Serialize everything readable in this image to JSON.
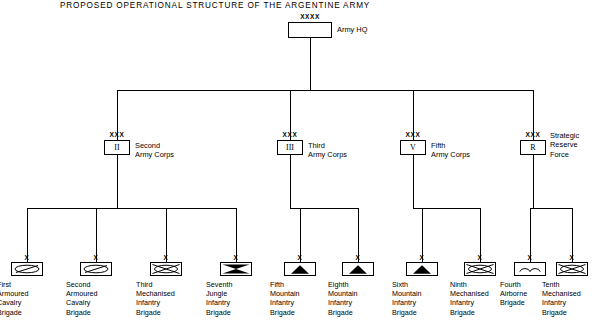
{
  "title": "PROPOSED OPERATIONAL STRUCTURE OF THE ARGENTINE ARMY",
  "hq": {
    "echelon": "XXXX",
    "label": "Army HQ",
    "symbol": "blank-hq-symbol"
  },
  "corps": [
    {
      "echelon": "XXX",
      "designator": "II",
      "label_lines": [
        "Second",
        "Army Corps"
      ],
      "symbol": "roman-numeral-2"
    },
    {
      "echelon": "XXX",
      "designator": "III",
      "label_lines": [
        "Third",
        "Army Corps"
      ],
      "symbol": "roman-numeral-3"
    },
    {
      "echelon": "XXX",
      "designator": "V",
      "label_lines": [
        "Fifth",
        "Army Corps"
      ],
      "symbol": "roman-numeral-5"
    },
    {
      "echelon": "XXX",
      "designator": "R",
      "label_lines": [
        "Strategic",
        "Reserve",
        "Force"
      ],
      "symbol": "reserve-force-r"
    }
  ],
  "brigades": [
    {
      "echelon": "X",
      "label_lines": [
        "First",
        "Armoured",
        "Cavalry",
        "Brigade"
      ],
      "symbol": "armoured-cavalry-symbol",
      "parent": "Second Army Corps"
    },
    {
      "echelon": "X",
      "label_lines": [
        "Second",
        "Armoured",
        "Cavalry",
        "Brigade"
      ],
      "symbol": "armoured-cavalry-symbol",
      "parent": "Second Army Corps"
    },
    {
      "echelon": "X",
      "label_lines": [
        "Third",
        "Mechanised",
        "Infantry",
        "Brigade"
      ],
      "symbol": "mechanised-infantry-symbol",
      "parent": "Second Army Corps"
    },
    {
      "echelon": "X",
      "label_lines": [
        "Seventh",
        "Jungle",
        "Infantry",
        "Brigade"
      ],
      "symbol": "jungle-infantry-symbol",
      "parent": "Second Army Corps"
    },
    {
      "echelon": "X",
      "label_lines": [
        "Fifth",
        "Mountain",
        "Infantry",
        "Brigade"
      ],
      "symbol": "mountain-infantry-symbol",
      "parent": "Third Army Corps"
    },
    {
      "echelon": "X",
      "label_lines": [
        "Eighth",
        "Mountain",
        "Infantry",
        "Brigade"
      ],
      "symbol": "mountain-infantry-symbol",
      "parent": "Third Army Corps"
    },
    {
      "echelon": "X",
      "label_lines": [
        "Sixth",
        "Mountain",
        "Infantry",
        "Brigade"
      ],
      "symbol": "mountain-infantry-symbol",
      "parent": "Fifth Army Corps"
    },
    {
      "echelon": "X",
      "label_lines": [
        "Ninth",
        "Mechanised",
        "Infantry",
        "Brigade"
      ],
      "symbol": "mechanised-infantry-symbol",
      "parent": "Fifth Army Corps"
    },
    {
      "echelon": "X",
      "label_lines": [
        "Fourth",
        "Airborne",
        "Brigade"
      ],
      "symbol": "airborne-symbol",
      "parent": "Strategic Reserve Force"
    },
    {
      "echelon": "X",
      "label_lines": [
        "Tenth",
        "Mechanised",
        "Infantry",
        "Brigade"
      ],
      "symbol": "mechanised-infantry-symbol",
      "parent": "Strategic Reserve Force"
    }
  ],
  "colors": {
    "line": "#000000",
    "fill": "#ffffff",
    "background": "#ffffff"
  }
}
